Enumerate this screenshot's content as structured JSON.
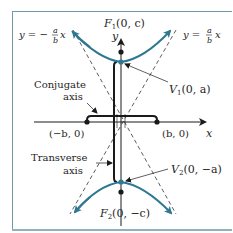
{
  "diagram": {
    "type": "hyperbola-vertical-transverse",
    "colors": {
      "curve": "#2e7892",
      "axes": "#1a1a1a",
      "frame": "#6f9aa8",
      "frame_bottom": "#8fb2bd",
      "background": "#ffffff"
    },
    "labels": {
      "focus_top": "F",
      "focus_top_sub": "1",
      "focus_top_coords": "(0, c)",
      "focus_bottom": "F",
      "focus_bottom_sub": "2",
      "focus_bottom_coords": "(0, −c)",
      "vertex_top": "V",
      "vertex_top_sub": "1",
      "vertex_top_coords": "(0, a)",
      "vertex_bottom": "V",
      "vertex_bottom_sub": "2",
      "vertex_bottom_coords": "(0, −a)",
      "point_left": "(−b, 0)",
      "point_right": "(b, 0)",
      "x_axis": "x",
      "y_axis": "y",
      "asymptote_left_prefix": "y = −",
      "asymptote_right_prefix": "y =",
      "fraction_num": "a",
      "fraction_den": "b",
      "asymptote_var": "x",
      "conjugate_axis_line1": "Conjugate",
      "conjugate_axis_line2": "axis",
      "transverse_axis_line1": "Transverse",
      "transverse_axis_line2": "axis"
    }
  }
}
